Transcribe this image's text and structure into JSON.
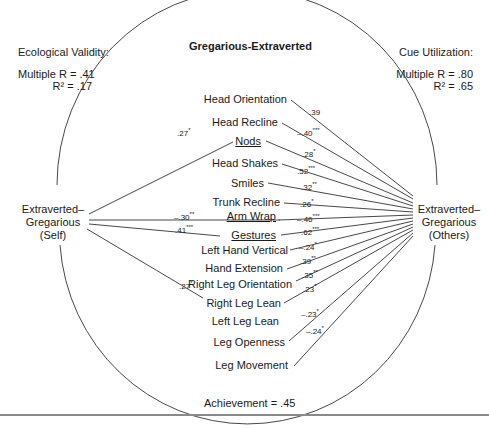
{
  "title": "Gregarious-Extraverted",
  "left_stats": {
    "heading": "Ecological Validity:",
    "multiple_r": "Multiple  R = .41",
    "r_squared": "R² = .17"
  },
  "right_stats": {
    "heading": "Cue Utilization:",
    "multiple_r": "Multiple  R = .80",
    "r_squared": "R² = .65"
  },
  "left_node": {
    "line1": "Extraverted–",
    "line2": "Gregarious",
    "line3": "(Self)"
  },
  "right_node": {
    "line1": "Extraverted–",
    "line2": "Gregarious",
    "line3": "(Others)"
  },
  "achievement": "Achievement = .45",
  "cues": [
    {
      "label": "Head Orientation",
      "underline": false
    },
    {
      "label": "Head Recline",
      "underline": false
    },
    {
      "label": "Nods",
      "underline": true
    },
    {
      "label": "Head Shakes",
      "underline": false
    },
    {
      "label": "Smiles",
      "underline": false
    },
    {
      "label": "Trunk Recline",
      "underline": false
    },
    {
      "label": "Arm Wrap",
      "underline": true
    },
    {
      "label": "Gestures",
      "underline": true
    },
    {
      "label": "Left Hand Vertical",
      "underline": false
    },
    {
      "label": "Hand Extension",
      "underline": false
    },
    {
      "label": "Right Leg Orientation",
      "underline": false
    },
    {
      "label": "Right Leg Lean",
      "underline": false
    },
    {
      "label": "Left Leg Lean",
      "underline": false
    },
    {
      "label": "Leg Openness",
      "underline": false
    },
    {
      "label": "Leg Movement",
      "underline": false
    }
  ],
  "validity_coefficients": [
    {
      "cue": "Nods",
      "value": ".27",
      "sig": "*"
    },
    {
      "cue": "Arm Wrap",
      "value": "–.30",
      "sig": "**"
    },
    {
      "cue": "Gestures",
      "value": ".41",
      "sig": "***"
    },
    {
      "cue": "Right Leg Lean",
      "value": ".27",
      "sig": "*"
    }
  ],
  "utilization_coefficients": [
    {
      "cue": "Head Orientation",
      "value": ".39",
      "sig": ""
    },
    {
      "cue": "Head Recline",
      "value": "–.40",
      "sig": "***"
    },
    {
      "cue": "Nods",
      "value": ".28",
      "sig": "*"
    },
    {
      "cue": "Head Shakes",
      "value": ".52",
      "sig": "***"
    },
    {
      "cue": "Smiles",
      "value": ".32",
      "sig": "**"
    },
    {
      "cue": "Trunk Recline",
      "value": ".26",
      "sig": "*"
    },
    {
      "cue": "Arm Wrap",
      "value": "–.46",
      "sig": "***"
    },
    {
      "cue": "Gestures",
      "value": ".62",
      "sig": "***"
    },
    {
      "cue": "Left Hand Vertical",
      "value": "–.24",
      "sig": "*"
    },
    {
      "cue": "Hand Extension",
      "value": ".39",
      "sig": "**"
    },
    {
      "cue": "Right Leg Orientation",
      "value": ".35",
      "sig": "**"
    },
    {
      "cue": "Right Leg Lean",
      "value": ".23",
      "sig": "*"
    },
    {
      "cue": "Leg Openness",
      "value": "–.23",
      "sig": "*"
    },
    {
      "cue": "Leg Movement",
      "value": "–.24",
      "sig": "*"
    }
  ],
  "colors": {
    "line": "#333333",
    "text": "#1a1a1a",
    "rule": "#8a8a8a"
  }
}
